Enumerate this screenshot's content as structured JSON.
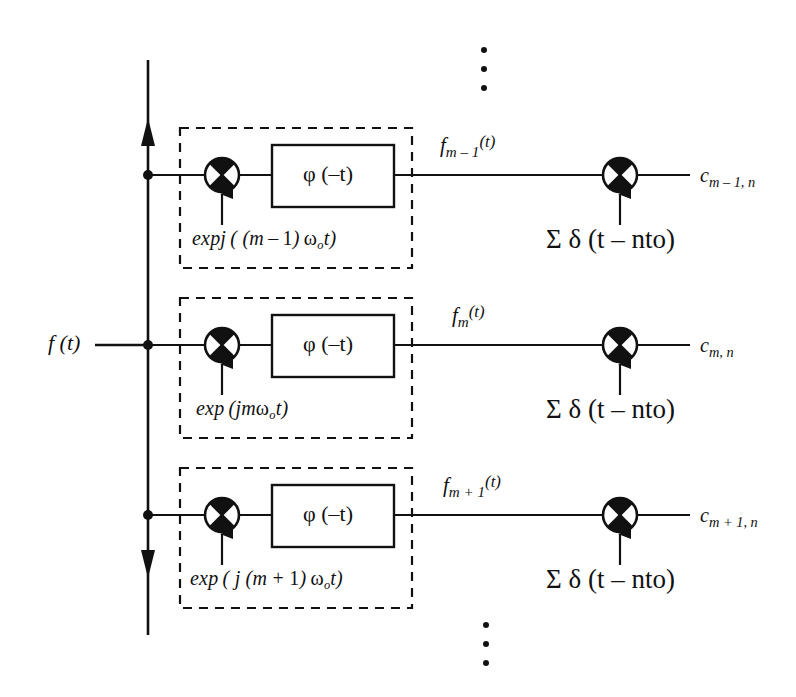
{
  "diagram": {
    "input_signal_label": "f (t)",
    "colors": {
      "ink": "#111111",
      "background": "#ffffff"
    },
    "top_ellipsis": "vertical-ellipsis",
    "bottom_ellipsis": "vertical-ellipsis",
    "branches": [
      {
        "id": "branch-m-minus-1",
        "modulator_label_parts": {
          "exp": "expj",
          "open": "( (",
          "index": "m",
          "operator": "–",
          "offset": "1",
          "close_index": ")",
          "omega": "ω",
          "omega_sub": "o",
          "time": "t",
          "close": ")"
        },
        "modulator_label": "expj ( (m – 1) ωo t)",
        "filter_label": "φ (–t)",
        "intermediate_label": "fm – 1 (t)",
        "intermediate_base": "f",
        "intermediate_sub": "m – 1",
        "intermediate_arg": "(t)",
        "sampler_label": "Σ δ (t – nto)",
        "output_label": "cm – 1, n",
        "output_base": "c",
        "output_sub": "m – 1, n"
      },
      {
        "id": "branch-m",
        "modulator_label_parts": {
          "exp": "exp",
          "open": "(",
          "index": "jm",
          "operator": "",
          "offset": "",
          "close_index": "",
          "omega": "ω",
          "omega_sub": "o",
          "time": "t",
          "close": ")"
        },
        "modulator_label": "exp (jmωo t)",
        "filter_label": "φ (–t)",
        "intermediate_label": "fm (t)",
        "intermediate_base": "f",
        "intermediate_sub": "m",
        "intermediate_arg": "(t)",
        "sampler_label": "Σ δ (t – nto)",
        "output_label": "cm, n",
        "output_base": "c",
        "output_sub": "m, n"
      },
      {
        "id": "branch-m-plus-1",
        "modulator_label_parts": {
          "exp": "exp",
          "open": "( j (",
          "index": "m",
          "operator": "+",
          "offset": "1",
          "close_index": ")",
          "omega": "ω",
          "omega_sub": "o",
          "time": "t",
          "close": ")"
        },
        "modulator_label": "exp (j (m + 1) ωo t)",
        "filter_label": "φ (–t)",
        "intermediate_label": "fm + 1 (t)",
        "intermediate_base": "f",
        "intermediate_sub": "m + 1",
        "intermediate_arg": "(t)",
        "sampler_label": "Σ δ (t – nto)",
        "output_label": "cm + 1, n",
        "output_base": "c",
        "output_sub": "m + 1, n"
      }
    ],
    "icons": {
      "multiplier": "multiplier-cross-circle",
      "junction": "junction-dot",
      "arrow_up": "arrow-up",
      "arrow_down": "arrow-down"
    }
  }
}
